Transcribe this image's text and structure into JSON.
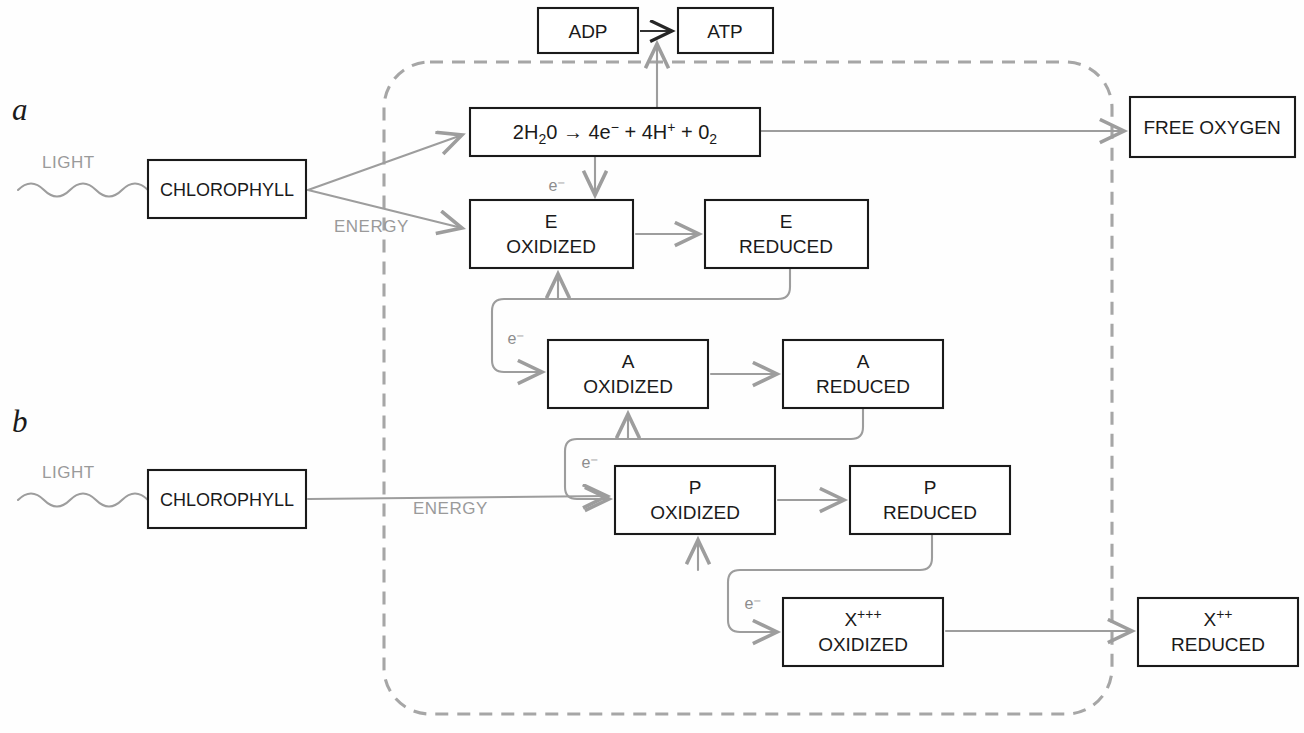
{
  "figure": {
    "panels": [
      {
        "id": "a",
        "label": "a"
      },
      {
        "id": "b",
        "label": "b"
      }
    ],
    "boxes": {
      "adp": {
        "label": "ADP",
        "x": 538,
        "y": 8,
        "w": 100,
        "h": 45
      },
      "atp": {
        "label": "ATP",
        "x": 678,
        "y": 8,
        "w": 95,
        "h": 45
      },
      "water": {
        "x": 470,
        "y": 108,
        "w": 290,
        "h": 48,
        "equation": "2H₂0 → 4e⁻ + 4H⁺ + 0₂",
        "equation_parts": [
          "2H",
          "2",
          "0",
          " → ",
          "4e",
          "−",
          " + ",
          "4H",
          "+",
          " + ",
          "0",
          "2"
        ]
      },
      "free_oxygen": {
        "label": "FREE OXYGEN",
        "x": 1130,
        "y": 97,
        "w": 165,
        "h": 60
      },
      "e_ox": {
        "line1": "E",
        "line2": "OXIDIZED",
        "x": 470,
        "y": 200,
        "w": 163,
        "h": 68
      },
      "e_red": {
        "line1": "E",
        "line2": "REDUCED",
        "x": 705,
        "y": 200,
        "w": 163,
        "h": 68
      },
      "a_ox": {
        "line1": "A",
        "line2": "OXIDIZED",
        "x": 548,
        "y": 340,
        "w": 160,
        "h": 68
      },
      "a_red": {
        "line1": "A",
        "line2": "REDUCED",
        "x": 783,
        "y": 340,
        "w": 160,
        "h": 68
      },
      "p_ox": {
        "line1": "P",
        "line2": "OXIDIZED",
        "x": 615,
        "y": 466,
        "w": 160,
        "h": 68
      },
      "p_red": {
        "line1": "P",
        "line2": "REDUCED",
        "x": 850,
        "y": 466,
        "w": 160,
        "h": 68
      },
      "x_ox": {
        "line1": "X",
        "line1_sup": "+++",
        "line2": "OXIDIZED",
        "x": 783,
        "y": 598,
        "w": 160,
        "h": 68
      },
      "x_red": {
        "line1": "X",
        "line1_sup": "++",
        "line2": "REDUCED",
        "x": 1138,
        "y": 598,
        "w": 160,
        "h": 68
      },
      "chlorophyll_a": {
        "label": "CHLOROPHYLL",
        "x": 148,
        "y": 160,
        "w": 158,
        "h": 58
      },
      "chlorophyll_b": {
        "label": "CHLOROPHYLL",
        "x": 148,
        "y": 470,
        "w": 158,
        "h": 58
      }
    },
    "labels": {
      "light_a": {
        "text": "LIGHT",
        "x": 42,
        "y": 168
      },
      "light_b": {
        "text": "LIGHT",
        "x": 42,
        "y": 478
      },
      "energy_a": {
        "text": "ENERGY",
        "x": 334,
        "y": 232
      },
      "energy_b": {
        "text": "ENERGY",
        "x": 413,
        "y": 514
      },
      "panel_a": {
        "text": "a",
        "x": 12,
        "y": 120
      },
      "panel_b": {
        "text": "b",
        "x": 12,
        "y": 432
      },
      "electrons": [
        {
          "text": "e⁻",
          "x": 557,
          "y": 191
        },
        {
          "text": "e⁻",
          "x": 516,
          "y": 344
        },
        {
          "text": "e⁻",
          "x": 590,
          "y": 468
        },
        {
          "text": "e⁻",
          "x": 753,
          "y": 609
        }
      ]
    },
    "boundary": {
      "description": "dashed-rounded-enclosure",
      "color": "#a6a6a6",
      "x": 384,
      "y": 62,
      "w": 728,
      "h": 652,
      "radius": 46
    },
    "colors": {
      "box_stroke": "#1a1a1a",
      "gray_arrow": "#9d9d9d",
      "black_arrow": "#262626",
      "gray_text": "#9a9a9a",
      "electron_text": "#8d8d8d",
      "background": "#fefefe"
    }
  }
}
